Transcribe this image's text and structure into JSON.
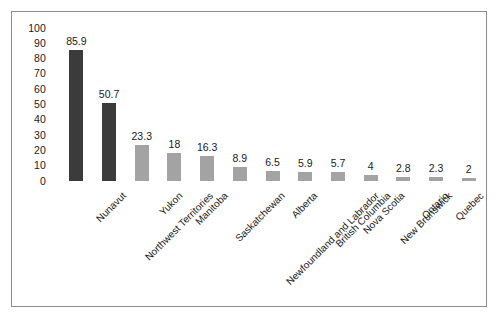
{
  "chart_data": {
    "type": "bar",
    "title": "",
    "subtitle": "",
    "xlabel": "",
    "ylabel": "",
    "ylim": [
      0,
      100
    ],
    "ytick_step": 10,
    "yticks": [
      "100",
      "90",
      "80",
      "70",
      "60",
      "50",
      "40",
      "30",
      "20",
      "10",
      "0"
    ],
    "grid": false,
    "legend": "none",
    "label_rotation_deg": -45,
    "categories": [
      "Nunavut",
      "Northwest Territories",
      "Yukon",
      "Manitoba",
      "Saskatchewan",
      "Newfoundland and Labrador",
      "Alberta",
      "British Columbia",
      "Nova Scotia",
      "New Brunswick",
      "Ontario",
      "Quebec",
      "Prince Edward Island"
    ],
    "values": [
      85.9,
      50.7,
      23.3,
      18,
      16.3,
      8.9,
      6.5,
      5.9,
      5.7,
      4,
      2.8,
      2.3,
      2
    ],
    "value_labels": [
      "85.9",
      "50.7",
      "23.3",
      "18",
      "16.3",
      "8.9",
      "6.5",
      "5.9",
      "5.7",
      "4",
      "2.8",
      "2.3",
      "2"
    ],
    "bar_colors": [
      "#3b3b3b",
      "#3b3b3b",
      "#a3a3a3",
      "#a3a3a3",
      "#a3a3a3",
      "#a3a3a3",
      "#a3a3a3",
      "#a3a3a3",
      "#a3a3a3",
      "#a3a3a3",
      "#a3a3a3",
      "#a3a3a3",
      "#a3a3a3"
    ],
    "colors": {
      "dark_bar": "#3b3b3b",
      "light_bar": "#a3a3a3",
      "frame": "#8c8c8c",
      "text": "#1a1a1a",
      "background": "#ffffff"
    }
  }
}
